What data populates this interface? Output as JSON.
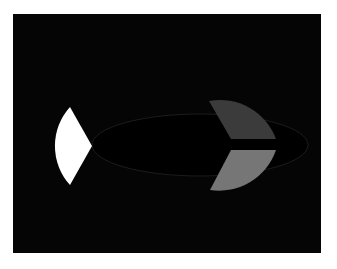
{
  "figure": {
    "background_color": "#050505",
    "page_color": "#ffffff",
    "shapes": [
      {
        "name": "white-wedge",
        "fill": "#ffffff"
      },
      {
        "name": "dark-grey-segment",
        "fill": "#3b3b3b"
      },
      {
        "name": "light-grey-segment",
        "fill": "#767676"
      },
      {
        "name": "ellipse-outline",
        "stroke": "#1c1c1c"
      }
    ]
  }
}
